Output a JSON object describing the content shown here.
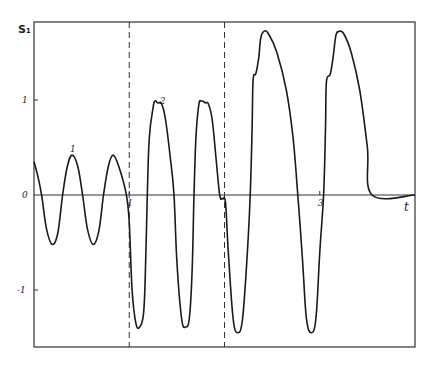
{
  "chart_data": {
    "type": "line",
    "title": "",
    "xlabel": "t",
    "ylabel": "S₁",
    "xlim": [
      0,
      4.0
    ],
    "ylim": [
      -1.6,
      1.82
    ],
    "grid": false,
    "x_ticks": [
      {
        "value": 1,
        "label": "1"
      },
      {
        "value": 3,
        "label": "3"
      }
    ],
    "y_ticks": [
      {
        "value": 1,
        "label": "1"
      },
      {
        "value": 0,
        "label": "0"
      },
      {
        "value": -1,
        "label": "-1"
      }
    ],
    "vertical_dashed_lines": [
      1,
      2
    ],
    "annotations": [
      {
        "text": "1",
        "x": 0.4,
        "y": 0.5
      },
      {
        "text": "2",
        "x": 1.34,
        "y": 1.0
      }
    ],
    "series": [
      {
        "name": "S1(t)",
        "points": [
          [
            0.0,
            0.35
          ],
          [
            0.04,
            0.2
          ],
          [
            0.08,
            0.0
          ],
          [
            0.13,
            -0.35
          ],
          [
            0.19,
            -0.52
          ],
          [
            0.25,
            -0.4
          ],
          [
            0.3,
            0.0
          ],
          [
            0.35,
            0.3
          ],
          [
            0.4,
            0.42
          ],
          [
            0.46,
            0.3
          ],
          [
            0.51,
            0.0
          ],
          [
            0.56,
            -0.35
          ],
          [
            0.62,
            -0.52
          ],
          [
            0.68,
            -0.38
          ],
          [
            0.73,
            0.0
          ],
          [
            0.78,
            0.3
          ],
          [
            0.83,
            0.42
          ],
          [
            0.89,
            0.3
          ],
          [
            0.97,
            0.0
          ],
          [
            1.0,
            -0.3
          ],
          [
            1.03,
            -1.0
          ],
          [
            1.07,
            -1.35
          ],
          [
            1.11,
            -1.39
          ],
          [
            1.15,
            -1.25
          ],
          [
            1.17,
            -0.8
          ],
          [
            1.19,
            0.0
          ],
          [
            1.21,
            0.6
          ],
          [
            1.25,
            0.92
          ],
          [
            1.27,
            0.99
          ],
          [
            1.3,
            0.97
          ],
          [
            1.34,
            0.96
          ],
          [
            1.38,
            0.8
          ],
          [
            1.43,
            0.4
          ],
          [
            1.47,
            0.0
          ],
          [
            1.5,
            -0.7
          ],
          [
            1.55,
            -1.3
          ],
          [
            1.59,
            -1.39
          ],
          [
            1.63,
            -1.3
          ],
          [
            1.66,
            -0.8
          ],
          [
            1.68,
            0.0
          ],
          [
            1.7,
            0.6
          ],
          [
            1.73,
            0.95
          ],
          [
            1.76,
            0.99
          ],
          [
            1.8,
            0.97
          ],
          [
            1.83,
            0.96
          ],
          [
            1.87,
            0.8
          ],
          [
            1.91,
            0.4
          ],
          [
            1.95,
            0.0
          ],
          [
            1.98,
            -0.04
          ],
          [
            2.01,
            -0.08
          ],
          [
            2.04,
            -0.6
          ],
          [
            2.09,
            -1.3
          ],
          [
            2.14,
            -1.45
          ],
          [
            2.19,
            -1.3
          ],
          [
            2.24,
            -0.6
          ],
          [
            2.27,
            0.0
          ],
          [
            2.29,
            0.7
          ],
          [
            2.3,
            1.21
          ],
          [
            2.33,
            1.28
          ],
          [
            2.36,
            1.45
          ],
          [
            2.38,
            1.65
          ],
          [
            2.41,
            1.72
          ],
          [
            2.46,
            1.7
          ],
          [
            2.55,
            1.5
          ],
          [
            2.65,
            1.1
          ],
          [
            2.72,
            0.6
          ],
          [
            2.77,
            0.0
          ],
          [
            2.82,
            -0.7
          ],
          [
            2.86,
            -1.3
          ],
          [
            2.91,
            -1.45
          ],
          [
            2.96,
            -1.3
          ],
          [
            3.0,
            -0.6
          ],
          [
            3.04,
            0.0
          ],
          [
            3.06,
            0.7
          ],
          [
            3.07,
            1.19
          ],
          [
            3.11,
            1.27
          ],
          [
            3.14,
            1.45
          ],
          [
            3.17,
            1.68
          ],
          [
            3.2,
            1.72
          ],
          [
            3.25,
            1.7
          ],
          [
            3.33,
            1.5
          ],
          [
            3.42,
            1.1
          ],
          [
            3.5,
            0.5
          ],
          [
            3.55,
            0.0
          ],
          [
            4.0,
            0.0
          ]
        ]
      }
    ]
  }
}
